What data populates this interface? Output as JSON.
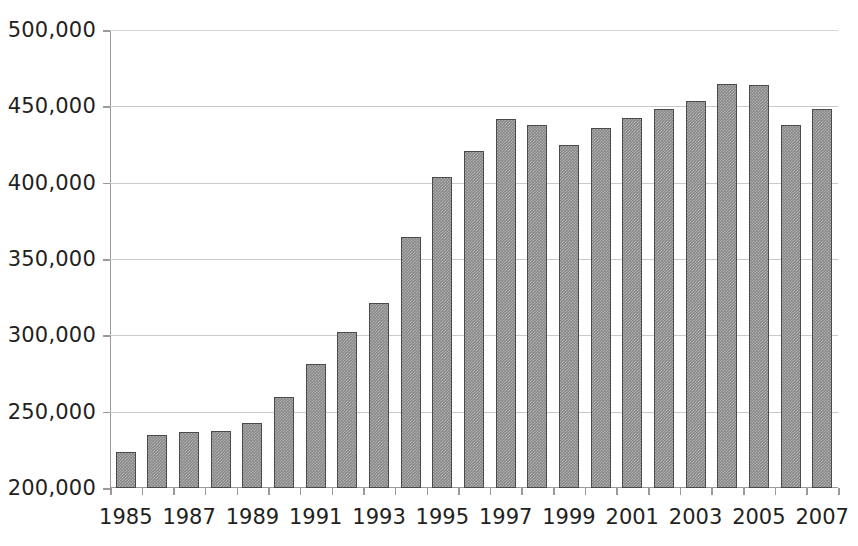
{
  "chart_data": {
    "type": "bar",
    "title": "",
    "subtitle": "",
    "xlabel": "",
    "ylabel": "",
    "ylim": [
      200000,
      500000
    ],
    "ytick_step": 50000,
    "grid": true,
    "legend": false,
    "legend_position": "none",
    "bar_color": "#8a8a8a",
    "bar_border_color": "#4a4a4a",
    "gridline_color": "#c9c9c9",
    "axis_color": "#9a9a9a",
    "text_color": "#231f20",
    "ytick_labels": [
      "500,000",
      "450,000",
      "400,000",
      "350,000",
      "300,000",
      "250,000",
      "200,000"
    ],
    "ytick_values": [
      500000,
      450000,
      400000,
      350000,
      300000,
      250000,
      200000
    ],
    "xtick_labels": [
      "1985",
      "1987",
      "1989",
      "1991",
      "1993",
      "1995",
      "1997",
      "1999",
      "2001",
      "2003",
      "2005",
      "2007"
    ],
    "categories": [
      "1985",
      "1986",
      "1987",
      "1988",
      "1989",
      "1990",
      "1991",
      "1992",
      "1993",
      "1994",
      "1995",
      "1996",
      "1997",
      "1998",
      "1999",
      "2000",
      "2001",
      "2002",
      "2003",
      "2004",
      "2005",
      "2006",
      "2007"
    ],
    "values": [
      223500,
      234500,
      237000,
      237500,
      242500,
      259500,
      281500,
      302500,
      321000,
      364500,
      404000,
      420500,
      442000,
      438000,
      425000,
      436000,
      442500,
      448500,
      453500,
      464500,
      464000,
      438000,
      448500
    ],
    "annotations": []
  }
}
